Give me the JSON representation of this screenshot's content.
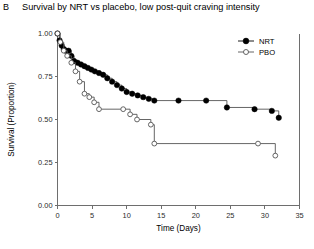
{
  "panel": {
    "label": "B"
  },
  "chart_data": {
    "type": "line",
    "title": "Survival by NRT vs placebo, low post-quit craving intensity",
    "xlabel": "Time (Days)",
    "ylabel": "Survival (Proportion)",
    "xlim": [
      0,
      35
    ],
    "ylim": [
      0,
      1
    ],
    "xticks": [
      0,
      5,
      10,
      15,
      20,
      25,
      30,
      35
    ],
    "xtick_labels": [
      "0",
      "5",
      "10",
      "15",
      "20",
      "25",
      "30",
      "35"
    ],
    "yticks": [
      0,
      0.25,
      0.5,
      0.75,
      1
    ],
    "ytick_labels": [
      "0.00",
      "0.25",
      "0.50",
      "0.75",
      "1.00"
    ],
    "grid": false,
    "legend_position": "top-right",
    "step_style": "post",
    "series": [
      {
        "name": "NRT",
        "marker": "filled-circle",
        "color": "#000000",
        "x": [
          0.0,
          0.3,
          0.6,
          0.9,
          1.2,
          1.6,
          2.0,
          2.4,
          2.9,
          3.4,
          3.9,
          4.4,
          4.9,
          5.4,
          6.0,
          6.6,
          7.2,
          7.9,
          8.6,
          9.3,
          10.0,
          10.8,
          11.6,
          12.4,
          13.2,
          14.0,
          17.5,
          21.5,
          24.5,
          28.5,
          31.0,
          32.0
        ],
        "y": [
          1.0,
          0.96,
          0.93,
          0.91,
          0.9,
          0.9,
          0.87,
          0.84,
          0.83,
          0.82,
          0.81,
          0.8,
          0.79,
          0.78,
          0.77,
          0.76,
          0.74,
          0.72,
          0.7,
          0.68,
          0.66,
          0.65,
          0.64,
          0.63,
          0.62,
          0.61,
          0.61,
          0.61,
          0.57,
          0.56,
          0.55,
          0.51
        ]
      },
      {
        "name": "PBO",
        "marker": "open-circle",
        "color": "#555555",
        "x": [
          0.0,
          0.4,
          0.9,
          1.4,
          2.0,
          2.6,
          3.2,
          3.9,
          4.6,
          5.3,
          6.0,
          9.5,
          10.5,
          11.5,
          13.5,
          14.0,
          29.0,
          31.5
        ],
        "y": [
          1.0,
          0.95,
          0.9,
          0.87,
          0.83,
          0.78,
          0.72,
          0.65,
          0.63,
          0.6,
          0.56,
          0.56,
          0.53,
          0.5,
          0.47,
          0.36,
          0.36,
          0.29
        ]
      }
    ]
  },
  "legend": {
    "items": [
      {
        "label": "NRT",
        "marker": "filled-circle"
      },
      {
        "label": "PBO",
        "marker": "open-circle"
      }
    ]
  }
}
